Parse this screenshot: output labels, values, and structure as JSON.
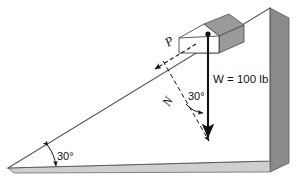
{
  "figure": {
    "background_color": "#ffffff",
    "outline_color": "#5a5a5a",
    "shade_color": "#8a8a8a",
    "block_shade_color": "#9a9a9a",
    "vector_color": "#111111"
  },
  "labels": {
    "applied_force": "P",
    "normal_force": "N",
    "weight": "W = 100 lb",
    "weight_symbol": "W",
    "weight_value": "100 lb",
    "incline_angle": "30°",
    "weight_normal_angle": "30°"
  },
  "geometry": {
    "incline_angle_deg": 30,
    "weight_magnitude": 100,
    "weight_units": "lb"
  }
}
